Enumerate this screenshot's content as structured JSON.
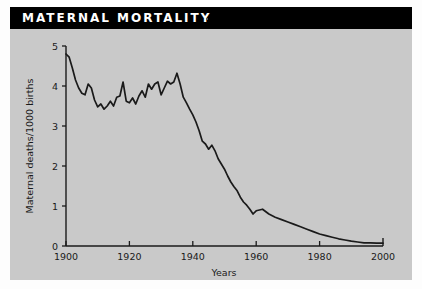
{
  "banner": {
    "title": "MATERNAL MORTALITY"
  },
  "colors": {
    "banner_background": "#000000",
    "banner_text": "#ffffff",
    "panel_background": "#c9c9c9",
    "page_background": "#fdfdfd",
    "axis": "#1a1a1a",
    "line": "#1a1a1a"
  },
  "chart_data": {
    "type": "line",
    "title": "MATERNAL MORTALITY",
    "xlabel": "Years",
    "ylabel": "Maternal deaths/1000 births",
    "xlim": [
      1900,
      2000
    ],
    "ylim": [
      0,
      5
    ],
    "xticks": [
      1900,
      1920,
      1940,
      1960,
      1980,
      2000
    ],
    "xtick_labels": [
      "1900",
      "1920",
      "1940",
      "1960",
      "1980",
      "2000"
    ],
    "yticks": [
      0,
      1,
      2,
      3,
      4,
      5
    ],
    "ytick_labels": [
      "0",
      "1",
      "2",
      "3",
      "4",
      "5"
    ],
    "grid": false,
    "legend": null,
    "series": [
      {
        "name": "Maternal deaths per 1000 births",
        "x": [
          1900,
          1901,
          1902,
          1903,
          1904,
          1905,
          1906,
          1907,
          1908,
          1909,
          1910,
          1911,
          1912,
          1913,
          1914,
          1915,
          1916,
          1917,
          1918,
          1919,
          1920,
          1921,
          1922,
          1923,
          1924,
          1925,
          1926,
          1927,
          1928,
          1929,
          1930,
          1931,
          1932,
          1933,
          1934,
          1935,
          1936,
          1937,
          1938,
          1939,
          1940,
          1941,
          1942,
          1943,
          1944,
          1945,
          1946,
          1947,
          1948,
          1949,
          1950,
          1951,
          1952,
          1953,
          1954,
          1955,
          1956,
          1957,
          1958,
          1959,
          1960,
          1962,
          1964,
          1966,
          1968,
          1970,
          1972,
          1974,
          1976,
          1978,
          1980,
          1982,
          1984,
          1986,
          1988,
          1990,
          1992,
          1994,
          1996,
          1998,
          2000
        ],
        "y": [
          4.8,
          4.72,
          4.45,
          4.15,
          3.95,
          3.82,
          3.78,
          4.05,
          3.95,
          3.65,
          3.48,
          3.55,
          3.42,
          3.5,
          3.62,
          3.5,
          3.72,
          3.75,
          4.1,
          3.62,
          3.58,
          3.7,
          3.55,
          3.75,
          3.88,
          3.72,
          4.05,
          3.92,
          4.05,
          4.1,
          3.78,
          3.95,
          4.12,
          4.05,
          4.1,
          4.32,
          4.05,
          3.72,
          3.58,
          3.42,
          3.28,
          3.1,
          2.88,
          2.62,
          2.55,
          2.42,
          2.52,
          2.38,
          2.18,
          2.05,
          1.92,
          1.75,
          1.6,
          1.48,
          1.38,
          1.22,
          1.1,
          1.02,
          0.92,
          0.8,
          0.88,
          0.92,
          0.8,
          0.72,
          0.66,
          0.6,
          0.54,
          0.48,
          0.42,
          0.36,
          0.3,
          0.26,
          0.22,
          0.18,
          0.15,
          0.12,
          0.1,
          0.08,
          0.08,
          0.07,
          0.07
        ]
      }
    ]
  }
}
